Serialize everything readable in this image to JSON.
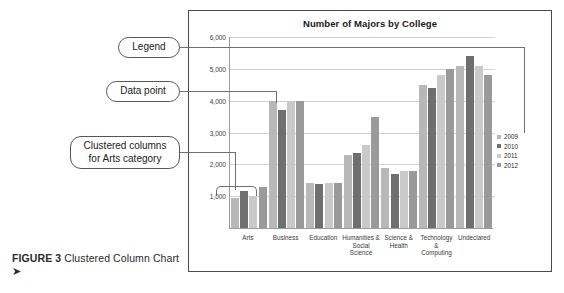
{
  "figure": {
    "label": "FIGURE 3",
    "caption": " Clustered Column Chart ",
    "arrow": "➤"
  },
  "callouts": {
    "legend": "Legend",
    "data_point": "Data point",
    "clustered_columns": "Clustered columns\nfor Arts category"
  },
  "chart_data": {
    "type": "bar",
    "title": "Number of Majors by College",
    "xlabel": "",
    "ylabel": "",
    "ylim": [
      0,
      6000
    ],
    "ytick_labels": [
      "6,000",
      "5,000",
      "4,000",
      "3,000",
      "2,000",
      "1,000"
    ],
    "ytick_values": [
      6000,
      5000,
      4000,
      3000,
      2000,
      1000
    ],
    "grid": true,
    "legend_position": "right",
    "categories": [
      "Arts",
      "Business",
      "Education",
      "Humanities &\nSocial Science",
      "Science &\nHealth",
      "Technology &\nComputing",
      "Undeclared"
    ],
    "series": [
      {
        "name": "2009",
        "color": "#b8b8b8",
        "values": [
          950,
          4000,
          1400,
          2300,
          1900,
          4500,
          5100
        ]
      },
      {
        "name": "2010",
        "color": "#6f6f6f",
        "values": [
          1150,
          3700,
          1380,
          2350,
          1700,
          4400,
          5400
        ]
      },
      {
        "name": "2011",
        "color": "#c9c9c9",
        "values": [
          1000,
          4000,
          1400,
          2600,
          1800,
          4800,
          5100
        ]
      },
      {
        "name": "2012",
        "color": "#9a9a9a",
        "values": [
          1300,
          4000,
          1400,
          3500,
          1800,
          5000,
          4800
        ]
      }
    ]
  }
}
